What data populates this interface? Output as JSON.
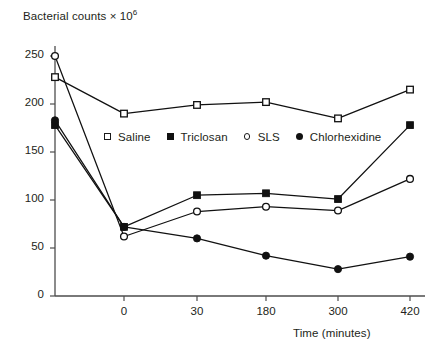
{
  "chart_data": {
    "type": "line",
    "title": "",
    "ylabel": "Bacterial counts × 10",
    "ylabel_exponent": "6",
    "xlabel": "Time (minutes)",
    "categories": [
      "",
      "0",
      "30",
      "180",
      "300",
      "420"
    ],
    "x_tick_labels": [
      "0",
      "30",
      "180",
      "300",
      "420"
    ],
    "y_tick_labels": [
      "0",
      "50",
      "100",
      "150",
      "200",
      "250"
    ],
    "ylim": [
      0,
      250
    ],
    "y_tick_values": [
      0,
      50,
      100,
      150,
      200,
      250
    ],
    "grid": false,
    "legend_position": "inside-upper-center",
    "series": [
      {
        "name": "Saline",
        "marker": "open-square",
        "color": "#111111",
        "values": [
          228,
          190,
          199,
          202,
          185,
          215
        ]
      },
      {
        "name": "Triclosan",
        "marker": "filled-square",
        "color": "#111111",
        "values": [
          178,
          72,
          105,
          107,
          101,
          178
        ]
      },
      {
        "name": "SLS",
        "marker": "open-circle",
        "color": "#111111",
        "values": [
          250,
          62,
          88,
          93,
          89,
          122
        ]
      },
      {
        "name": "Chlorhexidine",
        "marker": "filled-circle",
        "color": "#111111",
        "values": [
          183,
          72,
          60,
          42,
          28,
          41
        ]
      }
    ]
  },
  "axis": {
    "y_title_text": "Bacterial counts × 10",
    "y_title_exponent": "6",
    "x_title_text": "Time (minutes)"
  },
  "legend": {
    "items": [
      {
        "label": "Saline",
        "marker": "open-square"
      },
      {
        "label": "Triclosan",
        "marker": "filled-square"
      },
      {
        "label": "SLS",
        "marker": "open-circle"
      },
      {
        "label": "Chlorhexidine",
        "marker": "filled-circle"
      }
    ]
  },
  "colors": {
    "ink": "#231f20",
    "line": "#1a1a1a",
    "axis": "#4d4d4d",
    "background": "#ffffff"
  }
}
